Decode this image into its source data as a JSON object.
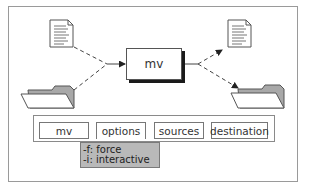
{
  "diagram": {
    "center_command": "mv",
    "sources": [
      {
        "type": "document",
        "icon": "document-icon"
      },
      {
        "type": "folder",
        "icon": "folder-icon"
      }
    ],
    "destinations": [
      {
        "type": "document",
        "icon": "document-icon"
      },
      {
        "type": "folder",
        "icon": "folder-icon"
      }
    ],
    "command_bar": {
      "items": [
        {
          "label": "mv"
        },
        {
          "label": "options"
        },
        {
          "label": "sources"
        },
        {
          "label": "destination"
        }
      ]
    },
    "options_dropdown": {
      "items": [
        {
          "label": "-f: force"
        },
        {
          "label": "-i: interactive"
        }
      ]
    },
    "colors": {
      "frame_border": "#9a9a9a",
      "dropdown_fill": "#b9b9b9",
      "folder_fill": "#a8a8a8",
      "shadow": "#1a1a1a"
    }
  }
}
